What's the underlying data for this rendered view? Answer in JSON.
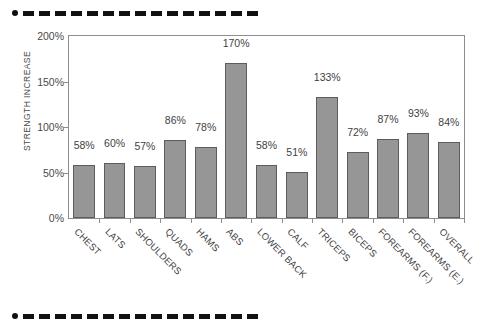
{
  "decorations": {
    "top_rule": "dotted-dashed-rule",
    "bottom_rule": "dotted-dashed-rule"
  },
  "chart_data": {
    "type": "bar",
    "title": "",
    "xlabel": "",
    "ylabel": "STRENGTH INCREASE",
    "ylim": [
      0,
      200
    ],
    "ytick_labels": [
      "0%",
      "50%",
      "100%",
      "150%",
      "200%"
    ],
    "ytick_values": [
      0,
      50,
      100,
      150,
      200
    ],
    "grid": false,
    "legend": null,
    "bar_color": "#969696",
    "bar_edge_color": "#5c5c5c",
    "value_suffix": "%",
    "categories": [
      "CHEST",
      "LATS",
      "SHOULDERS",
      "QUADS",
      "HAMS",
      "ABS",
      "LOWER BACK",
      "CALF",
      "TRICEPS",
      "BICEPS",
      "FOREARMS (F.)",
      "FOREARMS (E.)",
      "OVERALL"
    ],
    "values": [
      58,
      60,
      57,
      86,
      78,
      170,
      58,
      51,
      133,
      72,
      87,
      93,
      84
    ],
    "value_labels": [
      "58%",
      "60%",
      "57%",
      "86%",
      "78%",
      "170%",
      "58%",
      "51%",
      "133%",
      "72%",
      "87%",
      "93%",
      "84%"
    ]
  }
}
